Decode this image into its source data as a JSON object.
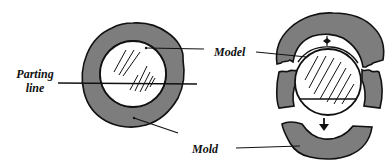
{
  "diagram": {
    "type": "mold-parting-line-illustration",
    "labels": {
      "parting_line": [
        "Parting",
        "line"
      ],
      "model": "Model",
      "mold": "Mold"
    },
    "colors": {
      "mold_fill": "#7d7d7d",
      "outline": "#111111",
      "model_fill": "#ffffff",
      "background": "#ffffff"
    },
    "parts": [
      {
        "id": "assembled-mold",
        "description": "Mold surrounding circular model with horizontal parting line"
      },
      {
        "id": "split-mold",
        "description": "Mold split along parting line; top half lifted up, bottom half pulled down, arrows indicating separation"
      }
    ]
  }
}
